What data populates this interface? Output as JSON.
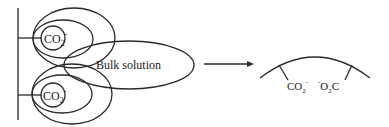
{
  "diagram": {
    "left_panel": {
      "top_group_label": {
        "main": "CO",
        "sub": "2",
        "sup": "-"
      },
      "bottom_group_label": {
        "main": "CO",
        "sub": "2",
        "sup": "-"
      },
      "bulk_label": "Bulk solution"
    },
    "arrow": {
      "direction": "right"
    },
    "right_panel": {
      "left_group": {
        "main": "CO",
        "sub": "2",
        "sup": "-"
      },
      "right_group": {
        "pre_sup": "-",
        "main1": "O",
        "sub": "2",
        "main2": "C"
      }
    },
    "colors": {
      "line": "#2a2a2a",
      "background": "#ffffff",
      "text": "#222222"
    }
  }
}
